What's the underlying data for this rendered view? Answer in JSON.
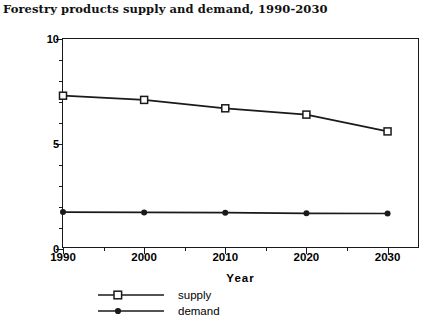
{
  "chart_data": {
    "type": "line",
    "title": "Forestry products supply and demand, 1990-2030",
    "xlabel": "Year",
    "ylabel": "Activity  level  (billions  of  1971$)",
    "x": [
      1990,
      2000,
      2010,
      2020,
      2030
    ],
    "xticklabels": [
      "1990",
      "2000",
      "2010",
      "2020",
      "2030"
    ],
    "yticklabels": [
      "0",
      "5",
      "10"
    ],
    "yticks": [
      0,
      5,
      10
    ],
    "xlim": [
      1990,
      2034
    ],
    "ylim": [
      0,
      10
    ],
    "grid": false,
    "legend_position": "below-axes-left",
    "series": [
      {
        "name": "supply",
        "marker": "open-square",
        "values": [
          7.3,
          7.1,
          6.7,
          6.4,
          5.6
        ]
      },
      {
        "name": "demand",
        "marker": "filled-circle",
        "values": [
          1.76,
          1.74,
          1.73,
          1.7,
          1.69
        ]
      }
    ],
    "colors": {
      "line": "#1a1a1a",
      "axis": "#1a1a1a",
      "background": "#ffffff"
    }
  }
}
